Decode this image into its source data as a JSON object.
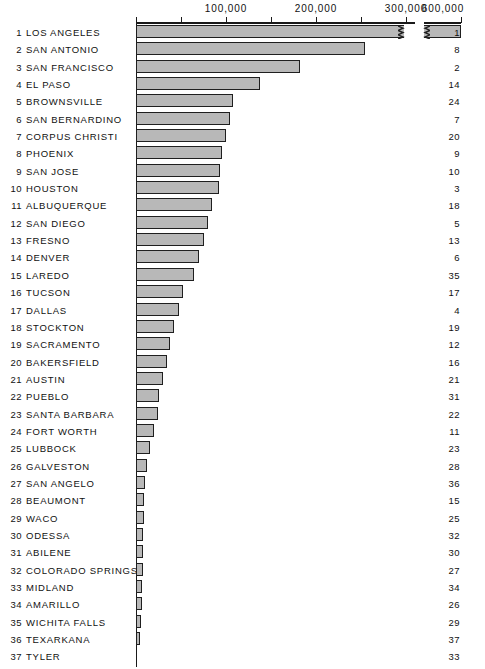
{
  "chart_data": {
    "type": "bar",
    "title": "",
    "subtitle": "",
    "xlabel": "",
    "ylabel": "",
    "orientation": "horizontal",
    "grid": false,
    "legend": null,
    "axis_break": {
      "present": true,
      "note": "scale break between 300,000 and 600,000",
      "break_after_value": 310000,
      "resume_value": 580000
    },
    "xlim": [
      0,
      620000
    ],
    "tick_values": [
      0,
      50000,
      100000,
      150000,
      200000,
      250000,
      300000,
      600000
    ],
    "tick_labels": [
      "",
      "",
      "100,000",
      "",
      "200,000",
      "",
      "300,000",
      "600,000"
    ],
    "labeled_ticks": [
      {
        "value": 100000,
        "label": "100,000",
        "x": 226
      },
      {
        "value": 200000,
        "label": "200,000",
        "x": 316
      },
      {
        "value": 300000,
        "label": "300,000",
        "x": 406
      },
      {
        "value": 600000,
        "label": "600,000",
        "x": 443
      }
    ],
    "categories": [
      "LOS ANGELES",
      "SAN ANTONIO",
      "SAN FRANCISCO",
      "EL PASO",
      "BROWNSVILLE",
      "SAN BERNARDINO",
      "CORPUS CHRISTI",
      "PHOENIX",
      "SAN JOSE",
      "HOUSTON",
      "ALBUQUERQUE",
      "SAN DIEGO",
      "FRESNO",
      "DENVER",
      "LAREDO",
      "TUCSON",
      "DALLAS",
      "STOCKTON",
      "SACRAMENTO",
      "BAKERSFIELD",
      "AUSTIN",
      "PUEBLO",
      "SANTA BARBARA",
      "FORT WORTH",
      "LUBBOCK",
      "GALVESTON",
      "SAN ANGELO",
      "BEAUMONT",
      "WACO",
      "ODESSA",
      "ABILENE",
      "COLORADO SPRINGS",
      "MIDLAND",
      "AMARILLO",
      "WICHITA FALLS",
      "TEXARKANA",
      "TYLER"
    ],
    "values": [
      600000,
      255000,
      182000,
      138000,
      108000,
      104000,
      100000,
      96000,
      94000,
      92000,
      84000,
      80000,
      76000,
      70000,
      64000,
      52000,
      48000,
      42000,
      38000,
      34000,
      30000,
      26000,
      24000,
      20000,
      16000,
      12000,
      9000,
      8000,
      7000,
      6000,
      5500,
      5000,
      4500,
      4000,
      3000,
      2000,
      1200
    ],
    "rows": [
      {
        "rank": "1",
        "name": "LOS ANGELES",
        "value": 600000,
        "bar_px": 268,
        "broken": true,
        "right": "1"
      },
      {
        "rank": "2",
        "name": "SAN ANTONIO",
        "value": 255000,
        "bar_px": 229,
        "broken": false,
        "right": "8"
      },
      {
        "rank": "3",
        "name": "SAN FRANCISCO",
        "value": 182000,
        "bar_px": 164,
        "broken": false,
        "right": "2"
      },
      {
        "rank": "4",
        "name": "EL PASO",
        "value": 138000,
        "bar_px": 124,
        "broken": false,
        "right": "14"
      },
      {
        "rank": "5",
        "name": "BROWNSVILLE",
        "value": 108000,
        "bar_px": 97,
        "broken": false,
        "right": "24"
      },
      {
        "rank": "6",
        "name": "SAN BERNARDINO",
        "value": 104000,
        "bar_px": 94,
        "broken": false,
        "right": "7"
      },
      {
        "rank": "7",
        "name": "CORPUS CHRISTI",
        "value": 100000,
        "bar_px": 90,
        "broken": false,
        "right": "20"
      },
      {
        "rank": "8",
        "name": "PHOENIX",
        "value": 96000,
        "bar_px": 86,
        "broken": false,
        "right": "9"
      },
      {
        "rank": "9",
        "name": "SAN JOSE",
        "value": 94000,
        "bar_px": 84,
        "broken": false,
        "right": "10"
      },
      {
        "rank": "10",
        "name": "HOUSTON",
        "value": 92000,
        "bar_px": 83,
        "broken": false,
        "right": "3"
      },
      {
        "rank": "11",
        "name": "ALBUQUERQUE",
        "value": 84000,
        "bar_px": 76,
        "broken": false,
        "right": "18"
      },
      {
        "rank": "12",
        "name": "SAN DIEGO",
        "value": 80000,
        "bar_px": 72,
        "broken": false,
        "right": "5"
      },
      {
        "rank": "13",
        "name": "FRESNO",
        "value": 76000,
        "bar_px": 68,
        "broken": false,
        "right": "13"
      },
      {
        "rank": "14",
        "name": "DENVER",
        "value": 70000,
        "bar_px": 63,
        "broken": false,
        "right": "6"
      },
      {
        "rank": "15",
        "name": "LAREDO",
        "value": 64000,
        "bar_px": 58,
        "broken": false,
        "right": "35"
      },
      {
        "rank": "16",
        "name": "TUCSON",
        "value": 52000,
        "bar_px": 47,
        "broken": false,
        "right": "17"
      },
      {
        "rank": "17",
        "name": "DALLAS",
        "value": 48000,
        "bar_px": 43,
        "broken": false,
        "right": "4"
      },
      {
        "rank": "18",
        "name": "STOCKTON",
        "value": 42000,
        "bar_px": 38,
        "broken": false,
        "right": "19"
      },
      {
        "rank": "19",
        "name": "SACRAMENTO",
        "value": 38000,
        "bar_px": 34,
        "broken": false,
        "right": "12"
      },
      {
        "rank": "20",
        "name": "BAKERSFIELD",
        "value": 34000,
        "bar_px": 31,
        "broken": false,
        "right": "16"
      },
      {
        "rank": "21",
        "name": "AUSTIN",
        "value": 30000,
        "bar_px": 27,
        "broken": false,
        "right": "21"
      },
      {
        "rank": "22",
        "name": "PUEBLO",
        "value": 26000,
        "bar_px": 23,
        "broken": false,
        "right": "31"
      },
      {
        "rank": "23",
        "name": "SANTA BARBARA",
        "value": 24000,
        "bar_px": 22,
        "broken": false,
        "right": "22"
      },
      {
        "rank": "24",
        "name": "FORT WORTH",
        "value": 20000,
        "bar_px": 18,
        "broken": false,
        "right": "11"
      },
      {
        "rank": "25",
        "name": "LUBBOCK",
        "value": 16000,
        "bar_px": 14,
        "broken": false,
        "right": "23"
      },
      {
        "rank": "26",
        "name": "GALVESTON",
        "value": 12000,
        "bar_px": 11,
        "broken": false,
        "right": "28"
      },
      {
        "rank": "27",
        "name": "SAN ANGELO",
        "value": 9000,
        "bar_px": 9,
        "broken": false,
        "right": "36"
      },
      {
        "rank": "28",
        "name": "BEAUMONT",
        "value": 8000,
        "bar_px": 8,
        "broken": false,
        "right": "15"
      },
      {
        "rank": "29",
        "name": "WACO",
        "value": 7000,
        "bar_px": 8,
        "broken": false,
        "right": "25"
      },
      {
        "rank": "30",
        "name": "ODESSA",
        "value": 6000,
        "bar_px": 7,
        "broken": false,
        "right": "32"
      },
      {
        "rank": "31",
        "name": "ABILENE",
        "value": 5500,
        "bar_px": 7,
        "broken": false,
        "right": "30"
      },
      {
        "rank": "32",
        "name": "COLORADO SPRINGS",
        "value": 5000,
        "bar_px": 7,
        "broken": false,
        "right": "27"
      },
      {
        "rank": "33",
        "name": "MIDLAND",
        "value": 4500,
        "bar_px": 6,
        "broken": false,
        "right": "34"
      },
      {
        "rank": "34",
        "name": "AMARILLO",
        "value": 4000,
        "bar_px": 6,
        "broken": false,
        "right": "26"
      },
      {
        "rank": "35",
        "name": "WICHITA FALLS",
        "value": 3000,
        "bar_px": 5,
        "broken": false,
        "right": "29"
      },
      {
        "rank": "36",
        "name": "TEXARKANA",
        "value": 2000,
        "bar_px": 4,
        "broken": false,
        "right": "37"
      },
      {
        "rank": "37",
        "name": "TYLER",
        "value": 1200,
        "bar_px": 0,
        "broken": false,
        "right": "33"
      }
    ],
    "colors": {
      "bar_fill": "#b8b8b8",
      "bar_stroke": "#1f1f1f",
      "text": "#111111",
      "background": "#ffffff"
    }
  }
}
